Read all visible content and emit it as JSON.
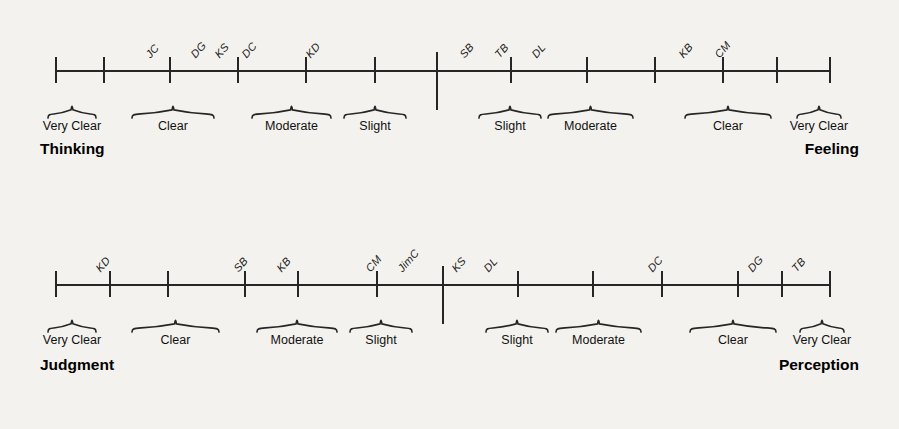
{
  "figure": {
    "type": "annotated-scale-diagram",
    "background_color": "#f4f2ee",
    "line_color": "#262626",
    "scales": [
      {
        "id": "thinking-feeling",
        "left_pole": "Thinking",
        "right_pole": "Feeling",
        "axis": {
          "x_start": 56,
          "x_end": 830,
          "center_x": 437,
          "tick_count": 13
        },
        "ticks": [
          56,
          104,
          170,
          238,
          306,
          375,
          437,
          511,
          587,
          655,
          723,
          777,
          830
        ],
        "center_tick_index": 6,
        "categories_left": [
          {
            "label": "Very Clear",
            "x_start": 48,
            "x_end": 96
          },
          {
            "label": "Clear",
            "x_start": 132,
            "x_end": 214
          },
          {
            "label": "Moderate",
            "x_start": 252,
            "x_end": 331
          },
          {
            "label": "Slight",
            "x_start": 344,
            "x_end": 406
          }
        ],
        "categories_right": [
          {
            "label": "Slight",
            "x_start": 479,
            "x_end": 541
          },
          {
            "label": "Moderate",
            "x_start": 548,
            "x_end": 633
          },
          {
            "label": "Clear",
            "x_start": 685,
            "x_end": 771
          },
          {
            "label": "Very Clear",
            "x_start": 797,
            "x_end": 841
          }
        ],
        "people": [
          {
            "initials": "JC",
            "x": 152,
            "side": "Thinking",
            "strength": "Clear"
          },
          {
            "initials": "DG",
            "x": 197,
            "side": "Thinking",
            "strength": "Clear"
          },
          {
            "initials": "KS",
            "x": 221,
            "side": "Thinking",
            "strength": "Moderate"
          },
          {
            "initials": "DC",
            "x": 248,
            "side": "Thinking",
            "strength": "Moderate"
          },
          {
            "initials": "KD",
            "x": 312,
            "side": "Thinking",
            "strength": "Slight"
          },
          {
            "initials": "SB",
            "x": 466,
            "side": "Feeling",
            "strength": "Slight"
          },
          {
            "initials": "TB",
            "x": 501,
            "side": "Feeling",
            "strength": "Slight"
          },
          {
            "initials": "DL",
            "x": 538,
            "side": "Feeling",
            "strength": "Moderate"
          },
          {
            "initials": "KB",
            "x": 685,
            "side": "Feeling",
            "strength": "Clear"
          },
          {
            "initials": "CM",
            "x": 721,
            "side": "Feeling",
            "strength": "Clear"
          }
        ]
      },
      {
        "id": "judgment-perception",
        "left_pole": "Judgment",
        "right_pole": "Perception",
        "axis": {
          "x_start": 56,
          "x_end": 830,
          "center_x": 443,
          "tick_count": 13
        },
        "ticks": [
          56,
          110,
          168,
          245,
          298,
          377,
          443,
          518,
          593,
          662,
          738,
          782,
          830
        ],
        "center_tick_index": 6,
        "categories_left": [
          {
            "label": "Very Clear",
            "x_start": 48,
            "x_end": 96
          },
          {
            "label": "Clear",
            "x_start": 132,
            "x_end": 219
          },
          {
            "label": "Moderate",
            "x_start": 257,
            "x_end": 337
          },
          {
            "label": "Slight",
            "x_start": 350,
            "x_end": 412
          }
        ],
        "categories_right": [
          {
            "label": "Slight",
            "x_start": 486,
            "x_end": 548
          },
          {
            "label": "Moderate",
            "x_start": 556,
            "x_end": 641
          },
          {
            "label": "Clear",
            "x_start": 690,
            "x_end": 776
          },
          {
            "label": "Very Clear",
            "x_start": 800,
            "x_end": 844
          }
        ],
        "people": [
          {
            "initials": "KD",
            "x": 102,
            "side": "Judgment",
            "strength": "Clear"
          },
          {
            "initials": "SB",
            "x": 240,
            "side": "Judgment",
            "strength": "Moderate"
          },
          {
            "initials": "KB",
            "x": 283,
            "side": "Judgment",
            "strength": "Moderate"
          },
          {
            "initials": "CM",
            "x": 372,
            "side": "Judgment",
            "strength": "Slight"
          },
          {
            "initials": "JimC",
            "x": 404,
            "side": "Judgment",
            "strength": "Slight"
          },
          {
            "initials": "KS",
            "x": 458,
            "side": "Perception",
            "strength": "Slight"
          },
          {
            "initials": "DL",
            "x": 490,
            "side": "Perception",
            "strength": "Slight"
          },
          {
            "initials": "DC",
            "x": 654,
            "side": "Perception",
            "strength": "Clear"
          },
          {
            "initials": "DG",
            "x": 754,
            "side": "Perception",
            "strength": "Very Clear"
          },
          {
            "initials": "TB",
            "x": 798,
            "side": "Perception",
            "strength": "Very Clear"
          }
        ]
      }
    ]
  }
}
